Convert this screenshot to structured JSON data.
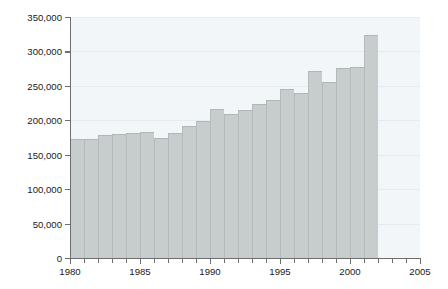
{
  "chart_data": {
    "type": "bar",
    "title": "",
    "subtitle": "",
    "xlabel": "",
    "ylabel": "BOD (kg per day)",
    "categories": [
      1980,
      1981,
      1982,
      1983,
      1984,
      1985,
      1986,
      1987,
      1988,
      1989,
      1990,
      1991,
      1992,
      1993,
      1994,
      1995,
      1996,
      1997,
      1998,
      1999,
      2000,
      2001
    ],
    "values": [
      173000,
      173000,
      179000,
      180000,
      182000,
      183000,
      175000,
      182000,
      192000,
      199000,
      216000,
      209000,
      215000,
      224000,
      229000,
      245000,
      240000,
      271000,
      255000,
      276000,
      277000,
      324000
    ],
    "xlim": [
      1980,
      2005
    ],
    "ylim": [
      0,
      350000
    ],
    "xticks": [
      1980,
      1981,
      1982,
      1983,
      1984,
      1985,
      1986,
      1987,
      1988,
      1989,
      1990,
      1991,
      1992,
      1993,
      1994,
      1995,
      1996,
      1997,
      1998,
      1999,
      2000,
      2001,
      2002,
      2003,
      2004,
      2005
    ],
    "xticklabels_major": [
      "1980",
      "1985",
      "1990",
      "1995",
      "2000",
      "2005"
    ],
    "xticklabels_major_values": [
      1980,
      1985,
      1990,
      1995,
      2000,
      2005
    ],
    "yticks": [
      0,
      50000,
      100000,
      150000,
      200000,
      250000,
      300000,
      350000
    ],
    "yticklabels": [
      "0",
      "50,000",
      "100,000",
      "150,000",
      "200,000",
      "250,000",
      "300,000",
      "350,000"
    ],
    "grid": true,
    "grid_axis": "y",
    "legend": null,
    "bar_color": "#c6cdcc",
    "plot_background": "#f3f6f9",
    "grid_color": "#e3ecf3",
    "axis_color": "#6e6e6e",
    "text_color": "#1a1a1a",
    "bar_width_years": 1
  }
}
